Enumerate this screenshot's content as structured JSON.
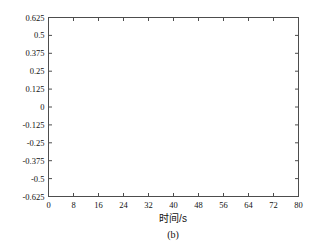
{
  "figure": {
    "caption": "(b)",
    "background_color": "#ffffff",
    "frame_color": "#4d4d4d",
    "line_color": "#1a1a1a"
  },
  "chart_data": {
    "type": "line",
    "title": "",
    "subtitle": "",
    "caption": "(b)",
    "xlabel": "时间/s",
    "ylabel": "",
    "xlim": [
      0,
      80
    ],
    "ylim": [
      -0.625,
      0.625
    ],
    "grid": false,
    "legend": null,
    "xticks": [
      0,
      8,
      16,
      24,
      32,
      40,
      48,
      56,
      64,
      72,
      80
    ],
    "xtick_labels": [
      "0",
      "8",
      "16",
      "24",
      "32",
      "40",
      "48",
      "56",
      "64",
      "72",
      "80"
    ],
    "yticks": [
      -0.625,
      -0.5,
      -0.375,
      -0.25,
      -0.125,
      0,
      0.125,
      0.25,
      0.375,
      0.5,
      0.625
    ],
    "ytick_labels": [
      "-0.625",
      "-0.5",
      "-0.375",
      "-0.25",
      "-0.125",
      "0",
      "0.125",
      "0.25",
      "0.375",
      "0.5",
      "0.625"
    ],
    "series": [
      {
        "name": "response",
        "data_start_x": 0.0,
        "data_end_x": 50.5,
        "initial_value": 0.15,
        "period": 2.0,
        "envelope_initial": 0.145,
        "envelope_saturation": 0.575,
        "growth_rate": 0.105,
        "envelope_points": [
          {
            "t": 0,
            "amp": 0.145
          },
          {
            "t": 2,
            "amp": 0.135
          },
          {
            "t": 4,
            "amp": 0.145
          },
          {
            "t": 6,
            "amp": 0.16
          },
          {
            "t": 8,
            "amp": 0.19
          },
          {
            "t": 10,
            "amp": 0.245
          },
          {
            "t": 12,
            "amp": 0.3
          },
          {
            "t": 14,
            "amp": 0.355
          },
          {
            "t": 16,
            "amp": 0.405
          },
          {
            "t": 18,
            "amp": 0.44
          },
          {
            "t": 20,
            "amp": 0.465
          },
          {
            "t": 22,
            "amp": 0.485
          },
          {
            "t": 24,
            "amp": 0.5
          },
          {
            "t": 26,
            "amp": 0.515
          },
          {
            "t": 28,
            "amp": 0.525
          },
          {
            "t": 30,
            "amp": 0.535
          },
          {
            "t": 32,
            "amp": 0.543
          },
          {
            "t": 34,
            "amp": 0.55
          },
          {
            "t": 36,
            "amp": 0.556
          },
          {
            "t": 38,
            "amp": 0.561
          },
          {
            "t": 40,
            "amp": 0.565
          },
          {
            "t": 42,
            "amp": 0.568
          },
          {
            "t": 44,
            "amp": 0.571
          },
          {
            "t": 46,
            "amp": 0.573
          },
          {
            "t": 48,
            "amp": 0.574
          },
          {
            "t": 50.5,
            "amp": 0.575
          }
        ]
      }
    ]
  }
}
